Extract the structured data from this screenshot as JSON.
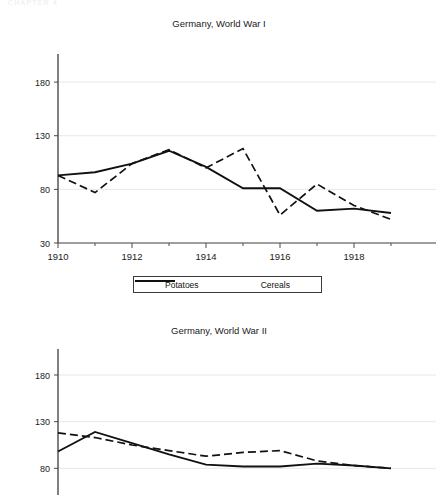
{
  "page": {
    "header_text": "CHAPTER 4"
  },
  "legend": {
    "position": "below-chart-1",
    "items": [
      {
        "label": "Potatoes",
        "style": "dashed",
        "color": "#111111"
      },
      {
        "label": "Cereals",
        "style": "solid",
        "color": "#111111"
      }
    ]
  },
  "chart_data": [
    {
      "type": "line",
      "title": "Germany, World War I",
      "xlabel": "",
      "ylabel": "",
      "x": [
        1910,
        1911,
        1912,
        1913,
        1914,
        1915,
        1916,
        1917,
        1918,
        1919
      ],
      "xlim": [
        1910,
        1919
      ],
      "ylim": [
        30,
        195
      ],
      "yticks": [
        30,
        80,
        130,
        180
      ],
      "xticks": [
        1910,
        1912,
        1914,
        1916,
        1918
      ],
      "minor_xticks": [
        1911,
        1913,
        1915,
        1917,
        1919
      ],
      "grid": "horizontal",
      "series": [
        {
          "name": "Potatoes",
          "style": "dashed",
          "color": "#111111",
          "values": [
            93,
            77,
            104,
            117,
            100,
            118,
            56,
            85,
            65,
            52
          ]
        },
        {
          "name": "Cereals",
          "style": "solid",
          "color": "#111111",
          "values": [
            93,
            96,
            104,
            116,
            101,
            81,
            81,
            60,
            62,
            58
          ]
        }
      ]
    },
    {
      "type": "line",
      "title": "Germany, World War II",
      "xlabel": "",
      "ylabel": "",
      "x": [
        1935,
        1936,
        1937,
        1938,
        1939,
        1940,
        1941,
        1942,
        1943,
        1944
      ],
      "xlim": [
        1935,
        1944
      ],
      "ylim": [
        30,
        195
      ],
      "yticks": [
        80,
        130,
        180
      ],
      "grid": "horizontal",
      "note": "bottom of chart cropped by screenshot edge",
      "series": [
        {
          "name": "Potatoes",
          "style": "dashed",
          "color": "#111111",
          "values": [
            118,
            113,
            105,
            99,
            93,
            97,
            99,
            88,
            83,
            80
          ]
        },
        {
          "name": "Cereals",
          "style": "solid",
          "color": "#111111",
          "values": [
            98,
            119,
            107,
            95,
            84,
            82,
            82,
            85,
            83,
            80
          ]
        }
      ]
    }
  ],
  "style": {
    "axis_color": "#4a4a4a",
    "grid_color": "#e8e8ea",
    "text_color": "#1b1b1b",
    "background": "#ffffff"
  }
}
